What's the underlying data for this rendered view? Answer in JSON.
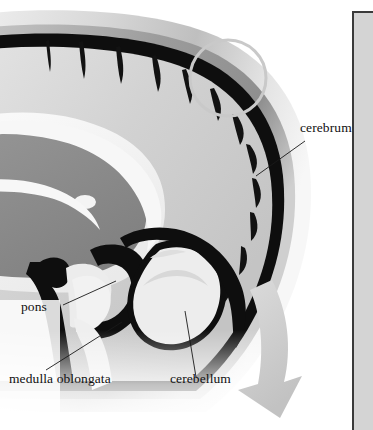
{
  "figure": {
    "type": "anatomical-illustration",
    "background_color": "#ffffff"
  },
  "labels": [
    {
      "id": "cerebrum",
      "text": "cerebrum"
    },
    {
      "id": "pons",
      "text": "pons"
    },
    {
      "id": "medulla_oblongata",
      "text": "medulla oblongata"
    },
    {
      "id": "cerebellum",
      "text": "cerebellum"
    }
  ],
  "annotations": {
    "highlight_circle": "highlight-circle",
    "direction_arrow": "curved-arrow"
  },
  "colors": {
    "outer_scalp": "#e8e8e8",
    "skull_gray": "#9c9c9c",
    "dura_black": "#0e0e0e",
    "cortex_light": "#d6d6d6",
    "white_matter": "#f0f0f0",
    "thalamus_gray": "#8a8a8a",
    "cerebellum_fill": "#ededed",
    "arrow_gray": "#cbcbcb",
    "circle_gray": "#c9c9c9",
    "leader_line": "#1a1a1a",
    "panel_fill": "#d4d4d4",
    "panel_border": "#3a3a3a",
    "label_text": "#111111"
  }
}
